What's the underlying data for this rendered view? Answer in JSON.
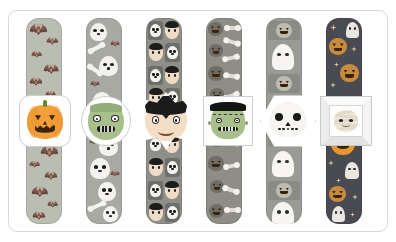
{
  "page": {
    "background_color": "#ffffff",
    "frame_border_color": "#d8d8d8",
    "width": 396,
    "height": 242
  },
  "bookmarks": [
    {
      "id": "bookmark-bat",
      "character": "pumpkin-face",
      "character_label": "Jack-o'-lantern",
      "medallion_shape": "rounded-square",
      "strip_pattern": "bats",
      "strip_pattern_label": "Black bats",
      "strip_color": "#b9bdb2",
      "accent_color": "#f2a03c",
      "x": 26
    },
    {
      "id": "bookmark-skull",
      "character": "zombie-face",
      "character_label": "Zombie",
      "medallion_shape": "circle",
      "strip_pattern": "skulls-and-bones",
      "strip_pattern_label": "Skulls, bones and bats",
      "strip_color": "#a9a9a4",
      "accent_color": "#a9c08c",
      "x": 86
    },
    {
      "id": "bookmark-grid",
      "character": "vampire-face",
      "character_label": "Vampire",
      "medallion_shape": "star-burst",
      "strip_pattern": "skull-vampire-grid",
      "strip_pattern_label": "Skull and vampire grid",
      "strip_color": "#8f8f8a",
      "accent_color": "#1b1b1b",
      "x": 146
    },
    {
      "id": "bookmark-pumpkin",
      "character": "frankenstein-face",
      "character_label": "Frankenstein's monster",
      "medallion_shape": "square",
      "strip_pattern": "pumpkins-and-bones",
      "strip_pattern_label": "Pumpkins and bones",
      "strip_color": "#8e8d86",
      "accent_color": "#a8bf8b",
      "x": 206
    },
    {
      "id": "bookmark-ghost",
      "character": "skull-face",
      "character_label": "Skull",
      "medallion_shape": "hexagon",
      "strip_pattern": "ghosts-and-pumpkins",
      "strip_pattern_label": "Ghosts and pumpkins",
      "strip_color": "#9b9b95",
      "accent_color": "#f7f6f2",
      "x": 266
    },
    {
      "id": "bookmark-night",
      "character": "mummy-face",
      "character_label": "Mummy",
      "medallion_shape": "beveled-square",
      "strip_pattern": "night-pumpkins-ghosts",
      "strip_pattern_label": "Night sky with pumpkins and ghosts",
      "strip_color": "#4a4a52",
      "accent_color": "#efe9db",
      "x": 326
    }
  ]
}
